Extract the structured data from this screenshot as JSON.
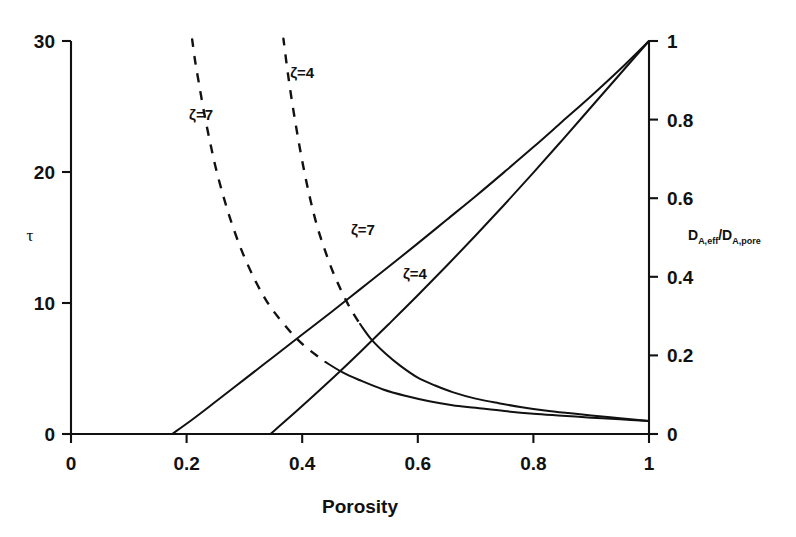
{
  "chart_data": {
    "type": "line",
    "title": "",
    "xlabel": "Porosity",
    "ylabel": "τ",
    "y2label": "D_A,eff/D_A,pore",
    "y2label_parts": {
      "d1": "D",
      "s1": "A,eff",
      "slash": "/",
      "d2": "D",
      "s2": "A,pore"
    },
    "xlim": [
      0,
      1
    ],
    "ylim": [
      0,
      30
    ],
    "y2lim": [
      0,
      1
    ],
    "grid": false,
    "legend": "inline-annotations",
    "xticks": [
      "0",
      "0.2",
      "0.4",
      "0.6",
      "0.8",
      "1"
    ],
    "xtickvals": [
      0,
      0.2,
      0.4,
      0.6,
      0.8,
      1
    ],
    "yticks": [
      "0",
      "10",
      "20",
      "30"
    ],
    "ytickvals": [
      0,
      10,
      20,
      30
    ],
    "y2ticks": [
      "0",
      "0.2",
      "0.4",
      "0.6",
      "0.8",
      "1"
    ],
    "y2tickvals": [
      0,
      0.2,
      0.4,
      0.6,
      0.8,
      1
    ],
    "annotations": [
      {
        "text": "ζ=7",
        "x": 0.225,
        "y": 24.0,
        "series": "tortuosity-zeta-7"
      },
      {
        "text": "ζ=4",
        "x": 0.4,
        "y": 27.2,
        "series": "tortuosity-zeta-4"
      },
      {
        "text": "ζ=7",
        "x": 0.505,
        "y": 15.2,
        "series": "diffusivity-zeta-7"
      },
      {
        "text": "ζ=4",
        "x": 0.595,
        "y": 11.8,
        "series": "diffusivity-zeta-4"
      }
    ],
    "series": [
      {
        "name": "tortuosity-zeta-7",
        "axis": "left",
        "style": "dashed-to-solid",
        "zeta": 7,
        "x": [
          0.205,
          0.21,
          0.215,
          0.222,
          0.23,
          0.24,
          0.25,
          0.262,
          0.275,
          0.29,
          0.305,
          0.32,
          0.335,
          0.35,
          0.37,
          0.39,
          0.41,
          0.44,
          0.47,
          0.5,
          0.54,
          0.58,
          0.62,
          0.66,
          0.7,
          0.75,
          0.8,
          0.85,
          0.9,
          0.95,
          1.0
        ],
        "y": [
          32.0,
          30.0,
          28.4,
          26.6,
          24.6,
          22.4,
          20.4,
          18.4,
          16.5,
          14.6,
          13.0,
          11.6,
          10.4,
          9.4,
          8.3,
          7.3,
          6.5,
          5.5,
          4.7,
          4.1,
          3.4,
          2.9,
          2.5,
          2.2,
          2.0,
          1.75,
          1.55,
          1.4,
          1.25,
          1.12,
          1.0
        ],
        "dash_until_x": 0.425
      },
      {
        "name": "tortuosity-zeta-4",
        "axis": "left",
        "style": "dashed-to-solid",
        "zeta": 4,
        "x": [
          0.363,
          0.368,
          0.375,
          0.383,
          0.392,
          0.402,
          0.413,
          0.425,
          0.438,
          0.452,
          0.467,
          0.483,
          0.5,
          0.52,
          0.545,
          0.57,
          0.6,
          0.63,
          0.66,
          0.7,
          0.74,
          0.78,
          0.82,
          0.86,
          0.9,
          0.95,
          1.0
        ],
        "y": [
          32.0,
          30.0,
          27.6,
          25.2,
          22.8,
          20.4,
          18.1,
          16.0,
          14.2,
          12.5,
          11.0,
          9.6,
          8.4,
          7.2,
          6.1,
          5.2,
          4.3,
          3.7,
          3.2,
          2.7,
          2.35,
          2.05,
          1.8,
          1.6,
          1.42,
          1.2,
          1.0
        ],
        "dash_until_x": 0.492
      },
      {
        "name": "diffusivity-zeta-7",
        "axis": "right",
        "style": "solid",
        "zeta": 7,
        "x": [
          0.175,
          0.21,
          0.25,
          0.3,
          0.35,
          0.4,
          0.45,
          0.5,
          0.55,
          0.6,
          0.65,
          0.7,
          0.75,
          0.8,
          0.85,
          0.9,
          0.95,
          1.0
        ],
        "y2": [
          0.0,
          0.037,
          0.082,
          0.139,
          0.196,
          0.253,
          0.31,
          0.368,
          0.426,
          0.485,
          0.545,
          0.605,
          0.667,
          0.73,
          0.795,
          0.86,
          0.928,
          1.0
        ]
      },
      {
        "name": "diffusivity-zeta-4",
        "axis": "right",
        "style": "solid",
        "zeta": 4,
        "x": [
          0.345,
          0.38,
          0.42,
          0.46,
          0.5,
          0.55,
          0.6,
          0.65,
          0.7,
          0.75,
          0.8,
          0.85,
          0.9,
          0.95,
          1.0
        ],
        "y2": [
          0.0,
          0.045,
          0.098,
          0.152,
          0.208,
          0.28,
          0.353,
          0.428,
          0.505,
          0.584,
          0.665,
          0.748,
          0.832,
          0.916,
          1.0
        ]
      }
    ]
  }
}
